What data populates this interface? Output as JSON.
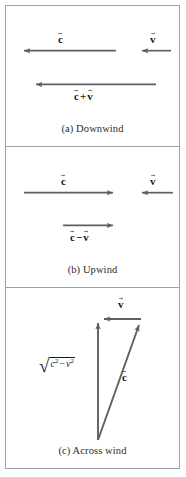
{
  "figure": {
    "stroke_color": "#5a6067",
    "frame_color": "#9aa3ad",
    "text_color": "#171717",
    "background": "#ffffff"
  },
  "panels": [
    {
      "id": "a",
      "caption": "(a) Downwind",
      "caption_index": "(a)",
      "caption_text": "Downwind",
      "vectors": [
        {
          "name": "c-vector",
          "label_base": "c",
          "label": "c⃗",
          "direction": "left",
          "x1": 110,
          "y1": 45,
          "x2": 15,
          "y2": 45,
          "label_x": 56,
          "label_y": 26
        },
        {
          "name": "v-vector",
          "label_base": "v",
          "label": "v⃗",
          "direction": "left",
          "x1": 165,
          "y1": 45,
          "x2": 133,
          "y2": 45,
          "label_x": 146,
          "label_y": 26
        },
        {
          "name": "c-plus-v-vector",
          "label_base": "c + v",
          "label": "c⃗ + v⃗",
          "direction": "left",
          "x1": 150,
          "y1": 79,
          "x2": 27,
          "y2": 79,
          "label_x": 72,
          "label_y": 86
        }
      ]
    },
    {
      "id": "b",
      "caption": "(b) Upwind",
      "caption_index": "(b)",
      "caption_text": "Upwind",
      "vectors": [
        {
          "name": "c-vector",
          "label_base": "c",
          "label": "c⃗",
          "direction": "right",
          "x1": 18,
          "y1": 46,
          "x2": 110,
          "y2": 46,
          "label_x": 58,
          "label_y": 27
        },
        {
          "name": "v-vector",
          "label_base": "v",
          "label": "v⃗",
          "direction": "left",
          "x1": 167,
          "y1": 46,
          "x2": 133,
          "y2": 46,
          "label_x": 146,
          "label_y": 27
        },
        {
          "name": "c-minus-v-vector",
          "label_base": "c − v",
          "label": "c⃗ − v⃗",
          "direction": "right",
          "x1": 57,
          "y1": 79,
          "x2": 110,
          "y2": 79,
          "label_x": 68,
          "label_y": 86
        }
      ]
    },
    {
      "id": "c",
      "caption": "(c) Across wind",
      "caption_index": "(c)",
      "caption_text": "Across wind",
      "vectors": [
        {
          "name": "resultant-vector",
          "label_base": "sqrt(c^2 - v^2)",
          "label": "√(c² − v²)",
          "direction": "up",
          "x1": 92,
          "y1": 152,
          "x2": 92,
          "y2": 32,
          "label_x": 40,
          "label_y": 68
        },
        {
          "name": "v-vector",
          "label_base": "v",
          "label": "v⃗",
          "direction": "left",
          "x1": 135,
          "y1": 31,
          "x2": 95,
          "y2": 31,
          "label_x": 113,
          "label_y": 12
        },
        {
          "name": "c-vector",
          "label_base": "c",
          "label": "c⃗",
          "direction": "up-right",
          "x1": 92,
          "y1": 152,
          "x2": 134,
          "y2": 33,
          "label_x": 117,
          "label_y": 85
        }
      ],
      "radical": {
        "sign": "√",
        "radicand_first": "c",
        "exponent_first": "2",
        "operator": "−",
        "radicand_second": "v",
        "exponent_second": "2"
      }
    }
  ]
}
